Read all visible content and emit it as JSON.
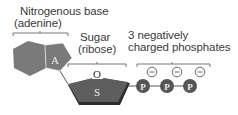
{
  "labels": {
    "base_line1": "Nitrogenous base",
    "base_line2": "(adenine)",
    "sugar_line1": "Sugar",
    "sugar_line2": "(ribose)",
    "phos_line1": "3 negatively",
    "phos_line2": "charged phosphates"
  },
  "molecule": {
    "base_letter": "A",
    "sugar_letter": "S",
    "oxygen_letter": "O",
    "phosphate_letter": "P",
    "charge_symbol": "−",
    "phosphate_count": 3
  },
  "colors": {
    "base_fill": "#7a7a7a",
    "sugar_fill": "#5e5e5e",
    "sugar_shadow": "#2e2e2e",
    "phosphate_fill": "#555555",
    "line": "#3a3a3a",
    "text": "#3a3a3a"
  }
}
